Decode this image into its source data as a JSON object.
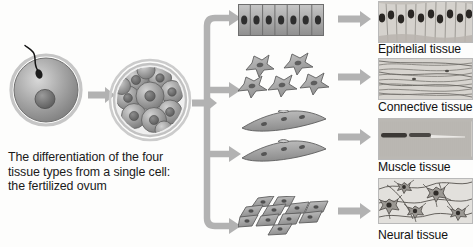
{
  "figure": {
    "caption_lines": [
      "The differentiation of the four",
      "tissue types from a single cell:",
      "the fertilized ovum"
    ],
    "accent_gray": "#b2b2b2",
    "cell_fill": "#9a9a9a",
    "nucleus_fill": "#6b6b6b"
  },
  "stages": {
    "fertilized_ovum": {
      "name": "fertilized ovum",
      "sperm": "sperm-with-flagellum",
      "nucleus": "ovum-nucleus"
    },
    "morula": {
      "name": "morula",
      "blastomere_count": 11,
      "membrane": "zona-pellucida"
    }
  },
  "branches": [
    {
      "id": "epithelial",
      "cell_diagram": "columnar-epithelial-cell-row",
      "cell_count": 7,
      "label": "Epithelial tissue",
      "micrograph": "columnar-epithelium-micrograph"
    },
    {
      "id": "connective",
      "cell_diagram": "stellate-fibroblast-cells",
      "cell_count": 5,
      "label": "Connective tissue",
      "micrograph": "collagen-fiber-micrograph"
    },
    {
      "id": "muscle",
      "cell_diagram": "multinucleated-muscle-fibers",
      "cell_count": 2,
      "label": "Muscle tissue",
      "micrograph": "striated-muscle-micrograph"
    },
    {
      "id": "neural",
      "cell_diagram": "clustered-neural-cells",
      "cell_count": 11,
      "label": "Neural tissue",
      "micrograph": "neuron-network-micrograph"
    }
  ]
}
